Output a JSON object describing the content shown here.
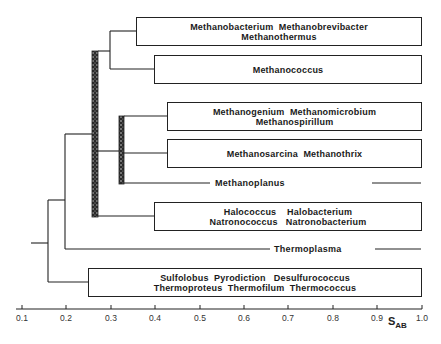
{
  "diagram": {
    "type": "dendrogram",
    "axis": {
      "label": "S",
      "label_subscript": "AB",
      "ticks": [
        "0.1",
        "0.2",
        "0.3",
        "0.4",
        "0.5",
        "0.6",
        "0.7",
        "0.8",
        "0.9",
        "1.0"
      ],
      "range": [
        0.1,
        1.0
      ]
    },
    "groups": [
      {
        "lines": [
          "Methanobacterium  Methanobrevibacter",
          "Methanothermus"
        ],
        "branch_start": 0.36
      },
      {
        "lines": [
          "Methanococcus"
        ],
        "branch_start": 0.4
      },
      {
        "lines": [
          "Methanogenium  Methanomicrobium",
          "Methanospirillum"
        ],
        "branch_start": 0.43
      },
      {
        "lines": [
          "Methanosarcina  Methanothrix"
        ],
        "branch_start": 0.43
      },
      {
        "lines": [
          "Methanoplanus"
        ],
        "type": "line"
      },
      {
        "lines": [
          "Halococcus    Halobacterium",
          "Natronococcus   Natronobacterium"
        ],
        "branch_start": 0.4
      },
      {
        "lines": [
          "Thermoplasma"
        ],
        "type": "line"
      },
      {
        "lines": [
          "Sulfolobus  Pyrodiction   Desulfurococcus",
          "Thermoproteus  Thermofilum  Thermococcus"
        ],
        "branch_start": 0.25
      }
    ],
    "nodes": [
      {
        "description": "Methanobacteriales + Methanococcus join",
        "s_ab": 0.3
      },
      {
        "description": "Shaded range (uncertain branching) major methanogen/halophile cluster",
        "s_ab": 0.26
      },
      {
        "description": "Shaded range Methanomicrobiales cluster",
        "s_ab": 0.32
      },
      {
        "description": "Thermoplasma join",
        "s_ab": 0.2
      },
      {
        "description": "Root: Sulfolobus/thermoproteus branch",
        "s_ab": 0.16
      }
    ]
  }
}
